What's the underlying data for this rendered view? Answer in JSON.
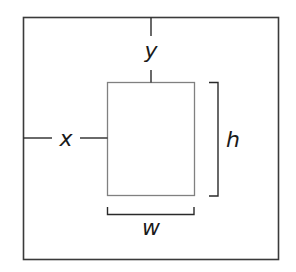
{
  "diagram": {
    "labels": {
      "x": "x",
      "y": "y",
      "w": "w",
      "h": "h"
    },
    "colors": {
      "outer_box": "#3a3a3a",
      "inner_box": "#808080",
      "dimension_lines": "#2a2a2a",
      "label_text": "#1a1a1a",
      "background": "#ffffff"
    },
    "outer_box": {
      "x": 23,
      "y": 17,
      "width": 255,
      "height": 242
    },
    "inner_box": {
      "x": 107,
      "y": 82,
      "width": 87,
      "height": 113
    }
  }
}
